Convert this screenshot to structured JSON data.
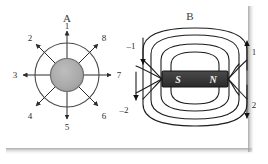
{
  "figure": {
    "background_color": "#ffffff",
    "line_color": "#2b2b2b",
    "shadow_color": "#b8b8b8"
  },
  "panel_a": {
    "title": "A",
    "source_label": "gray-sphere-source",
    "source_fill": "#a9a9a9",
    "source_stroke": "#6d6d6d",
    "ray_labels": [
      "1",
      "2",
      "3",
      "4",
      "5",
      "6",
      "7",
      "8"
    ],
    "ray_count": 8
  },
  "panel_b": {
    "title": "B",
    "magnet_fill": "#3a3a3a",
    "magnet_stroke": "#141414",
    "south_pole_label": "S",
    "north_pole_label": "N",
    "flux_labels": [
      "–1",
      "–2",
      "1",
      "2"
    ],
    "flux_label_left_top": "–1",
    "flux_label_left_bottom": "–2",
    "flux_label_right_top": "1",
    "flux_label_right_bottom": "2",
    "loop_count": 4
  }
}
